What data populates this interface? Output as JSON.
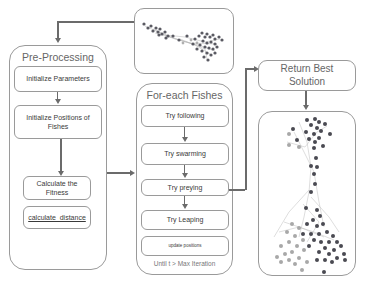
{
  "diagram": {
    "preprocessing": {
      "title": "Pre-Processing",
      "steps": [
        "Initialize Parameters",
        "Initialize Positions of Fishes",
        "Calculate the Fitness",
        "calculate_distance"
      ]
    },
    "initial_graph": {
      "label": "initial-network-graph"
    },
    "loop": {
      "title": "For-each Fishes",
      "steps": [
        "Try following",
        "Try swarming",
        "Try preying",
        "Try Leaping",
        "update positions"
      ],
      "condition": "Until t > Max Iteration"
    },
    "result": {
      "title": "Return Best Solution"
    },
    "final_graph": {
      "label": "best-solution-network-graph"
    },
    "colors": {
      "border": "#9a9a9a",
      "arrow": "#6b6b6b",
      "node_dark": "#4a4a52",
      "node_light": "#a8a8a8"
    }
  }
}
